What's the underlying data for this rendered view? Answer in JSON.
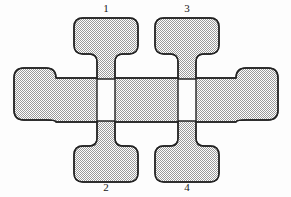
{
  "figure": {
    "name": "four-terminal-cross-device-pattern",
    "background_color": "#fdfdfd",
    "outline_color": "#232323",
    "fill_pattern": "checkerboard-dither",
    "fill_color_a": "#ffffff",
    "fill_color_b": "#9a9a9a",
    "fill_effective_color": "#d3d3d3",
    "outline_width": 1.4,
    "width": 291,
    "height": 197
  },
  "labels": {
    "top_left": "1",
    "top_right": "3",
    "bottom_left": "2",
    "bottom_right": "4"
  },
  "pads": [
    {
      "id": "pad-top-left",
      "label": "1",
      "position": "top-left",
      "shape": "rounded-rectangle",
      "x": 74,
      "y": 18,
      "width": 64,
      "height": 36,
      "radius": 9,
      "labeled": true
    },
    {
      "id": "pad-top-right",
      "label": "3",
      "position": "top-right",
      "shape": "rounded-rectangle",
      "x": 155,
      "y": 18,
      "width": 64,
      "height": 36,
      "radius": 9,
      "labeled": true
    },
    {
      "id": "pad-bottom-left",
      "label": "2",
      "position": "bottom-left",
      "shape": "rounded-rectangle",
      "x": 74,
      "y": 146,
      "width": 64,
      "height": 36,
      "radius": 9,
      "labeled": true
    },
    {
      "id": "pad-bottom-right",
      "label": "4",
      "position": "bottom-right",
      "shape": "rounded-rectangle",
      "x": 155,
      "y": 146,
      "width": 64,
      "height": 36,
      "radius": 9,
      "labeled": true
    },
    {
      "id": "pad-left",
      "label": "",
      "position": "left",
      "shape": "rounded-rectangle",
      "x": 14,
      "y": 68,
      "width": 42,
      "height": 52,
      "radius": 10,
      "labeled": false
    },
    {
      "id": "pad-right",
      "label": "",
      "position": "right",
      "shape": "rounded-rectangle",
      "x": 236,
      "y": 68,
      "width": 42,
      "height": 52,
      "radius": 10,
      "labeled": false
    }
  ],
  "channels": {
    "horizontal_bar": {
      "id": "central-horizontal-channel",
      "x_start": 56,
      "x_end": 236,
      "y_top": 78,
      "y_bottom": 122,
      "thickness": 44
    },
    "stems": [
      {
        "id": "stem-1",
        "connects": "pad-top-left",
        "x_center": 106,
        "y_start": 54,
        "y_end": 78,
        "width": 17
      },
      {
        "id": "stem-3",
        "connects": "pad-top-right",
        "x_center": 187,
        "y_start": 54,
        "y_end": 78,
        "width": 17
      },
      {
        "id": "stem-2",
        "connects": "pad-bottom-left",
        "x_center": 106,
        "y_start": 122,
        "y_end": 146,
        "width": 17
      },
      {
        "id": "stem-4",
        "connects": "pad-bottom-right",
        "x_center": 187,
        "y_start": 122,
        "y_end": 146,
        "width": 17
      }
    ]
  }
}
